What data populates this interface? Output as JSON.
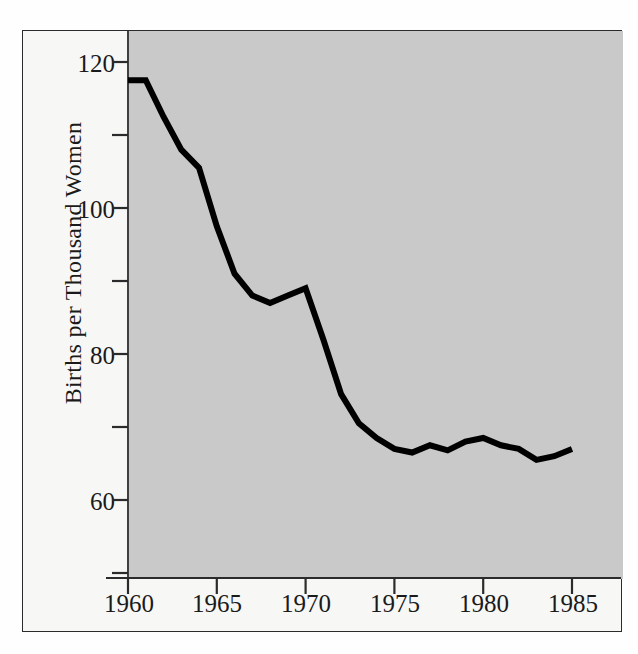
{
  "chart_data": {
    "type": "line",
    "title": "",
    "subtitle": "",
    "xlabel": "",
    "ylabel": "Births per Thousand Women",
    "xlim": [
      1959.0,
      1986.0
    ],
    "ylim": [
      50,
      124
    ],
    "xticks": [
      1960,
      1965,
      1970,
      1975,
      1980,
      1985
    ],
    "xtick_labels": [
      "1960",
      "1965",
      "1970",
      "1975",
      "1980",
      "1985"
    ],
    "yticks": [
      60,
      80,
      100,
      120
    ],
    "ytick_labels": [
      "60",
      "80",
      "100",
      "120"
    ],
    "yticks_minor": [
      50,
      70,
      90,
      110
    ],
    "grid": false,
    "legend": null,
    "series": [
      {
        "name": "Births per Thousand Women",
        "color": "#000000",
        "line_width": 6,
        "x": [
          1960,
          1961,
          1962,
          1963,
          1964,
          1965,
          1966,
          1967,
          1968,
          1969,
          1970,
          1971,
          1972,
          1973,
          1974,
          1975,
          1976,
          1977,
          1978,
          1979,
          1980,
          1981,
          1982,
          1983,
          1984,
          1985
        ],
        "values": [
          117.5,
          117.5,
          112.5,
          108.0,
          105.5,
          97.5,
          91.0,
          88.0,
          87.0,
          88.0,
          89.0,
          82.0,
          74.5,
          70.5,
          68.5,
          67.0,
          66.5,
          67.5,
          66.8,
          68.0,
          68.5,
          67.5,
          67.0,
          65.5,
          66.0,
          67.0
        ]
      }
    ],
    "annotations": [],
    "background_color": "#c9c9c9",
    "frame_color": "#2b2b2b"
  },
  "axis": {
    "y_title": "Births per Thousand Women",
    "y_tick_120": "120",
    "y_tick_100": "100",
    "y_tick_80": "80",
    "y_tick_60": "60",
    "x_tick_1960": "1960",
    "x_tick_1965": "1965",
    "x_tick_1970": "1970",
    "x_tick_1975": "1975",
    "x_tick_1980": "1980",
    "x_tick_1985": "1985"
  },
  "colors": {
    "line": "#000000",
    "plot_background": "#c9c9c9",
    "figure_background": "#f7f7f5",
    "frame": "#2b2b2b",
    "text": "#1a1a1a"
  }
}
